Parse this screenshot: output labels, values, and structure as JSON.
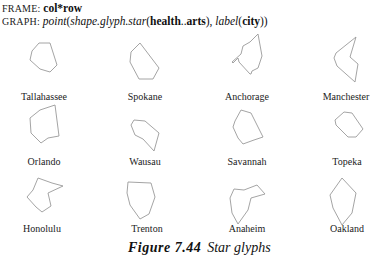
{
  "header": {
    "frame_label": "FRAME:",
    "frame_expr": "col*row",
    "graph_label": "GRAPH:",
    "graph_parts": {
      "point": "point",
      "open1": "(",
      "shape": "shape.glyph.star",
      "open2": "(",
      "var_from": "health",
      "range": "..",
      "var_to": "arts",
      "close2": "), ",
      "label": "label",
      "open3": "(",
      "label_var": "city",
      "close3": "))"
    }
  },
  "glyphs": [
    {
      "city": "Tallahassee",
      "points": "39,43 50,43 57,65 50,72 40,69 30,60 32,51",
      "label_x": 44,
      "label_y": 97
    },
    {
      "city": "Spokane",
      "points": "140,43 159,68 153,79 139,79 130,62 131,52",
      "label_x": 145,
      "label_y": 97
    },
    {
      "city": "Anchorage",
      "points": "258,34 262,56 258,68 252,71 251,74 250,74 239,62 238,58 233,63 232,62 241,54 243,46 250,42",
      "label_x": 247,
      "label_y": 97
    },
    {
      "city": "Manchester",
      "points": "356,37 350,57 358,64 355,82 337,66 334,58 336,53",
      "label_x": 346,
      "label_y": 97
    },
    {
      "city": "Orlando",
      "points": "55,105 59,136 48,138 41,143 31,133 30,118 40,110",
      "label_x": 44,
      "label_y": 162
    },
    {
      "city": "Wausau",
      "points": "134,120 145,121 159,133 154,151 143,139 135,135 131,125",
      "label_x": 145,
      "label_y": 162
    },
    {
      "city": "Savannah",
      "points": "241,110 251,113 263,137 254,140 243,144 238,138 233,127 235,121",
      "label_x": 247,
      "label_y": 162
    },
    {
      "city": "Topeka",
      "points": "344,112 352,113 363,129 356,137 348,137 336,125 335,120",
      "label_x": 347,
      "label_y": 162
    },
    {
      "city": "Honolulu",
      "points": "38,178 52,183 63,186 48,193 51,206 42,212 36,207 27,197 33,190",
      "label_x": 42,
      "label_y": 229
    },
    {
      "city": "Trenton",
      "points": "128,182 151,183 155,197 149,214 140,219 130,205 127,193",
      "label_x": 147,
      "label_y": 229
    },
    {
      "city": "Anaheim",
      "points": "257,185 265,194 251,198 248,210 238,224 232,213 230,198 234,189 244,190",
      "label_x": 247,
      "label_y": 229
    },
    {
      "city": "Oakland",
      "points": "342,178 356,193 352,213 342,225 333,208 330,195",
      "label_x": 347,
      "label_y": 229
    }
  ],
  "caption": {
    "number": "Figure 7.44",
    "text": "Star glyphs"
  },
  "colors": {
    "glyph_stroke": "#9a9a9a",
    "text": "#111111"
  }
}
